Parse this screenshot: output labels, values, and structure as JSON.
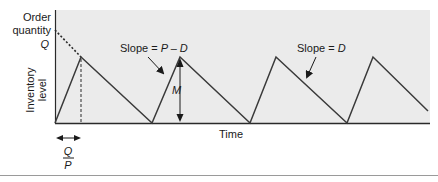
{
  "figure": {
    "y_axis_label_top": [
      "Order",
      "quantity"
    ],
    "y_axis_q_label": "Q",
    "y_axis_label_rotated": [
      "Inventory",
      "level"
    ],
    "x_axis_label": "Time",
    "slope_up_label_prefix": "Slope = ",
    "slope_up_label_var": "P – D",
    "slope_down_label_prefix": "Slope = ",
    "slope_down_label_var": "D",
    "max_inventory_label": "M",
    "interval_numerator": "Q",
    "interval_denominator": "P",
    "colors": {
      "plot_background": "#ebebeb",
      "line": "#3a3a3a",
      "axis": "#2a2a2a",
      "separator": "#9a9a9a"
    },
    "sawtooth_points": [
      [
        55,
        123
      ],
      [
        81,
        57
      ],
      [
        152,
        123
      ],
      [
        180,
        57
      ],
      [
        250,
        123
      ],
      [
        276,
        57
      ],
      [
        347,
        123
      ],
      [
        373,
        57
      ],
      [
        428,
        111
      ]
    ]
  }
}
